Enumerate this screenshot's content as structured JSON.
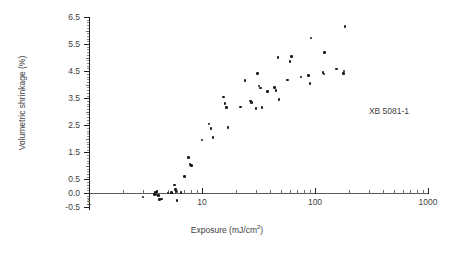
{
  "chart_data": {
    "type": "scatter",
    "title": "",
    "xlabel": "Exposure (mJ/cm2)",
    "xlabel_base": "Exposure (mJ/cm",
    "xlabel_sup": "2",
    "xlabel_tail": ")",
    "ylabel": "Volumetric shrinkage (%)",
    "xscale": "log",
    "yscale": "linear",
    "xlim": [
      1,
      1000
    ],
    "ylim": [
      -0.5,
      6.5
    ],
    "grid": false,
    "legend": "none",
    "annotations": [
      {
        "text": "XB 5081-1",
        "x": 300,
        "y": 3.0
      }
    ],
    "xticks": [
      1,
      10,
      100,
      1000
    ],
    "xtick_labels": [
      "1",
      "10",
      "100",
      "1000"
    ],
    "yticks": [
      -0.5,
      0.0,
      0.5,
      1.5,
      2.5,
      3.5,
      4.5,
      5.5,
      6.5
    ],
    "ytick_labels": [
      "-0.5",
      "0.0",
      "0.5",
      "1.5",
      "2.5",
      "3.5",
      "4.5",
      "5.5",
      "6.5"
    ],
    "ytick_minor": [
      1.0,
      2.0,
      3.0,
      4.0,
      5.0,
      6.0
    ],
    "marker": "circle",
    "marker_color": "#1a1a1a",
    "marker_size": 2.6,
    "series": [
      {
        "name": "XB 5081-1",
        "points": [
          [
            3.0,
            -0.15
          ],
          [
            3.8,
            -0.05
          ],
          [
            3.9,
            0.02
          ],
          [
            4.0,
            -0.08
          ],
          [
            4.0,
            0.05
          ],
          [
            4.1,
            -0.1
          ],
          [
            4.2,
            -0.25
          ],
          [
            4.4,
            -0.22
          ],
          [
            5.0,
            0.0
          ],
          [
            5.4,
            0.02
          ],
          [
            5.7,
            0.3
          ],
          [
            5.8,
            0.12
          ],
          [
            5.9,
            0.05
          ],
          [
            6.0,
            -0.28
          ],
          [
            6.5,
            0.02
          ],
          [
            7.0,
            0.6
          ],
          [
            7.6,
            1.32
          ],
          [
            7.8,
            1.05
          ],
          [
            8.0,
            1.0
          ],
          [
            8.1,
            1.02
          ],
          [
            10.0,
            1.95
          ],
          [
            11.5,
            2.55
          ],
          [
            12.0,
            2.38
          ],
          [
            12.5,
            2.05
          ],
          [
            15.5,
            3.55
          ],
          [
            16.0,
            3.3
          ],
          [
            16.5,
            3.15
          ],
          [
            17.0,
            2.42
          ],
          [
            22.0,
            3.18
          ],
          [
            24.0,
            4.15
          ],
          [
            27.0,
            3.4
          ],
          [
            27.5,
            3.35
          ],
          [
            30.0,
            3.12
          ],
          [
            31.0,
            4.42
          ],
          [
            32.0,
            3.95
          ],
          [
            33.0,
            3.88
          ],
          [
            34.0,
            3.15
          ],
          [
            38.0,
            3.75
          ],
          [
            44.0,
            3.9
          ],
          [
            45.0,
            3.78
          ],
          [
            47.0,
            5.0
          ],
          [
            48.0,
            3.45
          ],
          [
            57.0,
            4.18
          ],
          [
            60.0,
            4.85
          ],
          [
            62.0,
            5.05
          ],
          [
            75.0,
            4.28
          ],
          [
            88.0,
            4.35
          ],
          [
            90.0,
            4.05
          ],
          [
            92.0,
            5.72
          ],
          [
            118.0,
            4.45
          ],
          [
            120.0,
            4.4
          ],
          [
            122.0,
            5.18
          ],
          [
            155.0,
            4.58
          ],
          [
            178.0,
            4.42
          ],
          [
            180.0,
            4.5
          ],
          [
            185.0,
            6.15
          ]
        ]
      }
    ]
  }
}
